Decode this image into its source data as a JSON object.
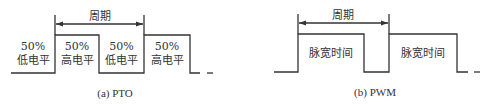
{
  "colors": {
    "line": "#333333",
    "background": "#ffffff"
  },
  "pto": {
    "caption": "(a) PTO",
    "period_label": "周期",
    "segments": [
      {
        "pct": "50%",
        "level": "低电平"
      },
      {
        "pct": "50%",
        "level": "高电平"
      },
      {
        "pct": "50%",
        "level": "低电平"
      },
      {
        "pct": "50%",
        "level": "高电平"
      }
    ]
  },
  "pwm": {
    "caption": "(b) PWM",
    "period_label": "周期",
    "pulses": [
      {
        "label": "脉宽时间"
      },
      {
        "label": "脉宽时间"
      }
    ]
  }
}
